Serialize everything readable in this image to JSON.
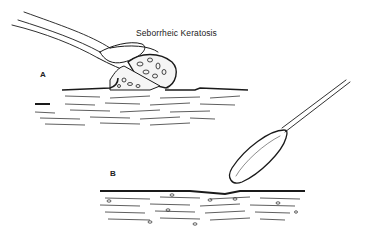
{
  "figure": {
    "title": "Seborrheic Keratosis",
    "panels": [
      {
        "label": "A",
        "description": "Curette lifting seborrheic keratosis lesion from skin surface"
      },
      {
        "label": "B",
        "description": "Curette over smooth skin surface after removal"
      }
    ],
    "colors": {
      "ink": "#1a1a1a",
      "background": "#ffffff"
    }
  }
}
